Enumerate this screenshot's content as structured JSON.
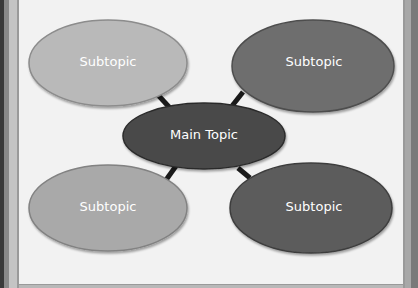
{
  "diagram": {
    "type": "mind-map",
    "main_topic": {
      "label": "Main Topic",
      "color": "#4a4a4a"
    },
    "subtopics": [
      {
        "label": "Subtopic",
        "position": "top-left",
        "color": "#b9b9b9"
      },
      {
        "label": "Subtopic",
        "position": "top-right",
        "color": "#6e6e6e"
      },
      {
        "label": "Subtopic",
        "position": "bottom-left",
        "color": "#a9a9a9"
      },
      {
        "label": "Subtopic",
        "position": "bottom-right",
        "color": "#5c5c5c"
      }
    ],
    "connector_color": "#1a1a1a"
  }
}
